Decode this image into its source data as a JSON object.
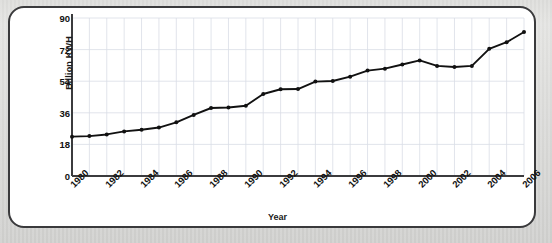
{
  "chart_data": {
    "type": "line",
    "title": "",
    "xlabel": "Year",
    "ylabel": "Billion KWH",
    "x": [
      1980,
      1981,
      1982,
      1983,
      1984,
      1985,
      1986,
      1987,
      1988,
      1989,
      1990,
      1991,
      1992,
      1993,
      1994,
      1995,
      1996,
      1997,
      1998,
      1999,
      2000,
      2001,
      2002,
      2003,
      2004,
      2005,
      2006
    ],
    "values": [
      14.3,
      14.5,
      15.1,
      16.2,
      16.8,
      17.6,
      19.5,
      22.2,
      24.7,
      24.9,
      25.5,
      29.8,
      31.5,
      31.6,
      34.3,
      34.5,
      36.1,
      38.3,
      39.0,
      40.5,
      42.0,
      40.0,
      39.6,
      40.0,
      46.2,
      48.6,
      52.3
    ],
    "ylim": [
      0,
      90
    ],
    "xlim": [
      1980,
      2006
    ],
    "yticks": [
      "0",
      "18",
      "36",
      "54",
      "72",
      "90"
    ],
    "ytick_values": [
      0,
      18,
      36,
      54,
      72,
      90
    ],
    "xticks": [
      "1980",
      "1982",
      "1984",
      "1986",
      "1988",
      "1990",
      "1992",
      "1994",
      "1996",
      "1998",
      "2000",
      "2002",
      "2004",
      "2006"
    ],
    "xtick_values": [
      1980,
      1982,
      1984,
      1986,
      1988,
      1990,
      1992,
      1994,
      1996,
      1998,
      2000,
      2002,
      2004,
      2006
    ],
    "grid": true,
    "legend": "none",
    "marker": "circle",
    "line_color": "#111111",
    "grid_color": "#d9dde6",
    "axis_color": "#3b3b3d",
    "card_border_color": "#3a3a3c",
    "background_color": "#ffffff",
    "page_background_color": "#d8d8d6"
  }
}
